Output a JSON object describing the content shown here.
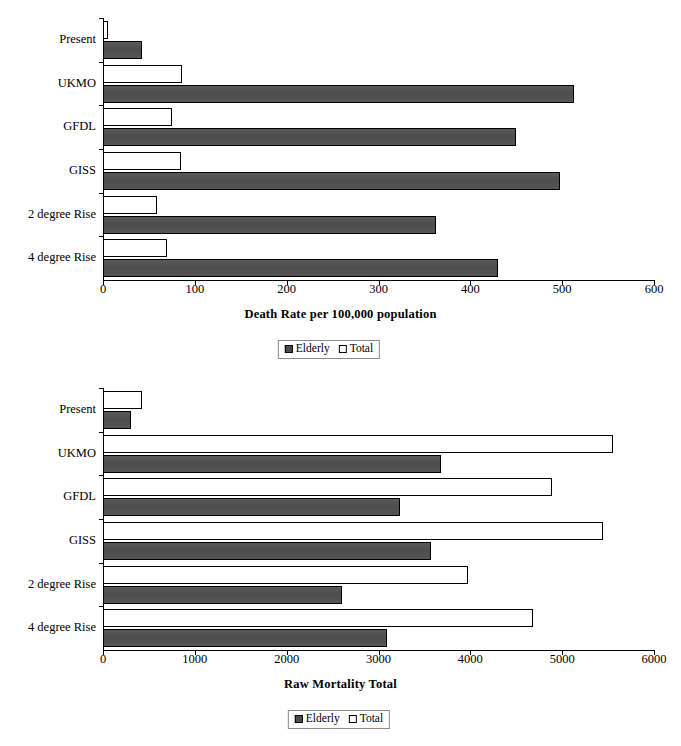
{
  "charts": [
    {
      "id": "death-rate",
      "type": "bar",
      "orientation": "horizontal",
      "title": "",
      "xlabel": "Death Rate per 100,000 population",
      "ylabel": "",
      "categories": [
        "Present",
        "UKMO",
        "GFDL",
        "GISS",
        "2 degree Rise",
        "4 degree Rise"
      ],
      "series": [
        {
          "name": "Elderly",
          "color": "#4d4d4d",
          "values": [
            42,
            513,
            450,
            498,
            363,
            430
          ]
        },
        {
          "name": "Total",
          "color": "#ffffff",
          "values": [
            5,
            86,
            75,
            85,
            59,
            70
          ]
        }
      ],
      "xticks": [
        0,
        100,
        200,
        300,
        400,
        500,
        600
      ],
      "xlim": [
        0,
        600
      ],
      "grid": false,
      "legend": {
        "position": "bottom-center",
        "entries": [
          "Elderly",
          "Total"
        ]
      }
    },
    {
      "id": "raw-mortality",
      "type": "bar",
      "orientation": "horizontal",
      "title": "",
      "xlabel": "Raw Mortality Total",
      "ylabel": "",
      "categories": [
        "Present",
        "UKMO",
        "GFDL",
        "GISS",
        "2 degree Rise",
        "4 degree Rise"
      ],
      "series": [
        {
          "name": "Elderly",
          "color": "#4d4d4d",
          "values": [
            300,
            3680,
            3230,
            3570,
            2600,
            3090
          ]
        },
        {
          "name": "Total",
          "color": "#ffffff",
          "values": [
            430,
            5550,
            4890,
            5440,
            3980,
            4680
          ]
        }
      ],
      "xticks": [
        0,
        1000,
        2000,
        3000,
        4000,
        5000,
        6000
      ],
      "xlim": [
        0,
        6000
      ],
      "grid": false,
      "legend": {
        "position": "bottom-center",
        "entries": [
          "Elderly",
          "Total"
        ]
      }
    }
  ],
  "chart_data": [
    {
      "type": "bar",
      "orientation": "horizontal",
      "title": "Death Rate per 100,000 population",
      "xlabel": "Death Rate per 100,000 population",
      "ylabel": "",
      "categories": [
        "Present",
        "UKMO",
        "GFDL",
        "GISS",
        "2 degree Rise",
        "4 degree Rise"
      ],
      "series": [
        {
          "name": "Elderly",
          "values": [
            42,
            513,
            450,
            498,
            363,
            430
          ]
        },
        {
          "name": "Total",
          "values": [
            5,
            86,
            75,
            85,
            59,
            70
          ]
        }
      ],
      "xlim": [
        0,
        600
      ],
      "xticks": [
        0,
        100,
        200,
        300,
        400,
        500,
        600
      ],
      "grid": false,
      "legend_position": "bottom-center"
    },
    {
      "type": "bar",
      "orientation": "horizontal",
      "title": "Raw Mortality Total",
      "xlabel": "Raw Mortality Total",
      "ylabel": "",
      "categories": [
        "Present",
        "UKMO",
        "GFDL",
        "GISS",
        "2 degree Rise",
        "4 degree Rise"
      ],
      "series": [
        {
          "name": "Elderly",
          "values": [
            300,
            3680,
            3230,
            3570,
            2600,
            3090
          ]
        },
        {
          "name": "Total",
          "values": [
            430,
            5550,
            4890,
            5440,
            3980,
            4680
          ]
        }
      ],
      "xlim": [
        0,
        6000
      ],
      "xticks": [
        0,
        1000,
        2000,
        3000,
        4000,
        5000,
        6000
      ],
      "grid": false,
      "legend_position": "bottom-center"
    }
  ]
}
